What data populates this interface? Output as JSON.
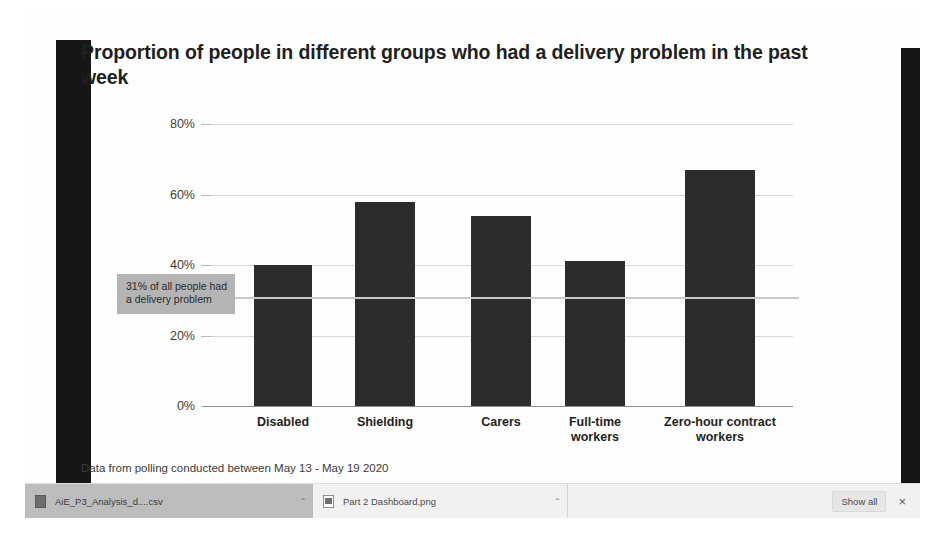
{
  "chart_data": {
    "type": "bar",
    "title": "Proportion of people in different groups who had a delivery problem in the past week",
    "xlabel": "",
    "ylabel": "",
    "ylim": [
      0,
      80
    ],
    "grid": true,
    "legend": "none",
    "categories": [
      "Disabled",
      "Shielding",
      "Carers",
      "Full-time workers",
      "Zero-hour contract workers"
    ],
    "values": [
      40,
      58,
      54,
      41,
      67
    ],
    "ytick_labels": [
      "0%",
      "20%",
      "40%",
      "60%",
      "80%"
    ],
    "ytick_values": [
      0,
      20,
      40,
      60,
      80
    ],
    "annotations": [
      {
        "text": "31% of all people had a delivery problem",
        "value": 31,
        "type": "reference-line"
      }
    ],
    "footnote": "Data from polling conducted between May 13 - May 19 2020",
    "bar_color": "#2c2c2c",
    "gridline_color": "#d6d6d6",
    "reference_line_color": "#c9c9c9",
    "annotation_bg_color": "#b4b4b4"
  },
  "chart": {
    "title": "Proportion of people in different groups who had a delivery problem in the past week",
    "footnote": "Data from polling conducted between May 13 - May 19 2020",
    "annotation": "31% of all people had a delivery problem"
  },
  "downloads": {
    "items": [
      {
        "filename": "AiE_P3_Analysis_d....csv",
        "caret": "⌃",
        "icon": "csv-file-icon"
      },
      {
        "filename": "Part 2 Dashboard.png",
        "caret": "⌃",
        "icon": "png-file-icon"
      }
    ],
    "show_all_label": "Show all",
    "close_label": "×"
  }
}
